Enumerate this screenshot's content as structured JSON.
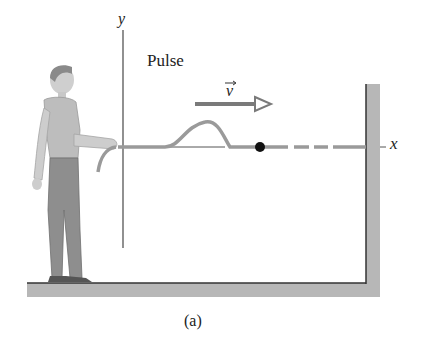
{
  "figure": {
    "pulse_label": "Pulse",
    "velocity_label": "v",
    "y_axis_label": "y",
    "x_axis_label": "x",
    "caption": "(a)"
  },
  "colors": {
    "string": "#9a9a9a",
    "axis": "#444444",
    "wall": "#b9b9b9",
    "arrow": "#7a7a7a",
    "dot": "#111111"
  }
}
